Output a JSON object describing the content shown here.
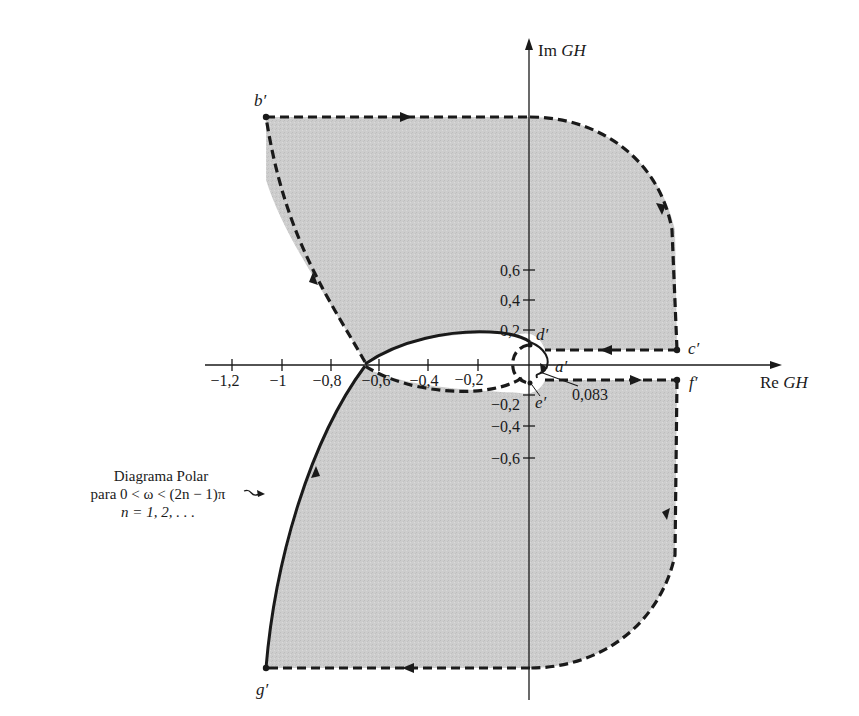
{
  "figure": {
    "type": "nyquist-diagram",
    "background": "#ffffff",
    "region_fill": "#cfcfcf",
    "stroke_color": "#1a1a1a",
    "axes": {
      "x_label_prefix": "Re ",
      "x_label_var": "GH",
      "y_label_prefix": "Im ",
      "y_label_var": "GH",
      "x_ticks": [
        "−1,2",
        "−1",
        "−0,8",
        "−0,6",
        "−0,4",
        "−0,2"
      ],
      "x_tick_values": [
        -1.2,
        -1.0,
        -0.8,
        -0.6,
        -0.4,
        -0.2
      ],
      "y_ticks_pos": [
        "0,6",
        "0,4",
        "0,2"
      ],
      "y_ticks_neg": [
        "−0,2",
        "−0,4",
        "−0,6"
      ],
      "y_tick_values": [
        0.6,
        0.4,
        0.2,
        -0.2,
        -0.4,
        -0.6
      ]
    },
    "points": {
      "a": "a′",
      "b": "b′",
      "c": "c′",
      "d": "d′",
      "e": "e′",
      "f": "f′",
      "g": "g′"
    },
    "annotation_value": "0,083",
    "caption": {
      "line1": "Diagrama Polar",
      "line2": "para 0 < ω < (2n − 1)π",
      "line3": "n = 1, 2, . . ."
    }
  }
}
